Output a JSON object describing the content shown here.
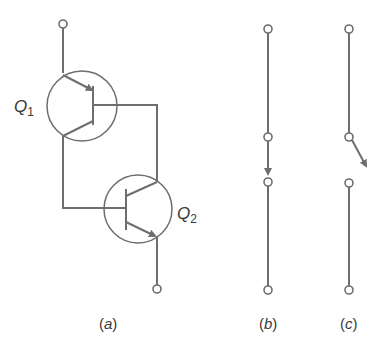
{
  "figure": {
    "panels": [
      {
        "id": "a",
        "caption_open": "(",
        "caption_letter": "a",
        "caption_close": ")",
        "description": "two-transistor latch (thyristor model)"
      },
      {
        "id": "b",
        "caption_open": "(",
        "caption_letter": "b",
        "caption_close": ")",
        "description": "closed switch"
      },
      {
        "id": "c",
        "caption_open": "(",
        "caption_letter": "c",
        "caption_close": ")",
        "description": "open switch"
      }
    ],
    "transistors": [
      {
        "name": "Q",
        "subscript": "1",
        "type": "PNP"
      },
      {
        "name": "Q",
        "subscript": "2",
        "type": "NPN"
      }
    ],
    "colors": {
      "line": "#6e6e6e",
      "text": "#3a3a3a",
      "background": "#ffffff"
    }
  }
}
